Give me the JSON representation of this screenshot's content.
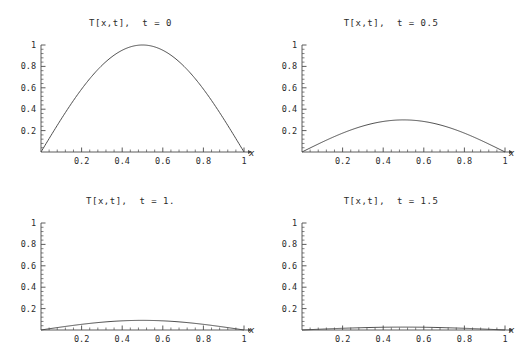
{
  "figure": {
    "name": "heat-equation-time-series",
    "layout": {
      "rows": 2,
      "cols": 2
    },
    "background_color": "#ffffff",
    "line_color": "#454545",
    "axis_color": "#4a4a4a",
    "text_color": "#2b2b2b"
  },
  "panels": [
    {
      "id": "panel-t0",
      "title": "T[x,t],  t = 0",
      "title_prefix": "T",
      "time_value": "0",
      "xlabel": "x",
      "ylabel": "",
      "peak": 1.0
    },
    {
      "id": "panel-t05",
      "title": "T[x,t],  t = 0.5",
      "title_prefix": "T",
      "time_value": "0.5",
      "xlabel": "x",
      "ylabel": "",
      "peak": 0.3
    },
    {
      "id": "panel-t1",
      "title": "T[x,t],  t = 1.",
      "title_prefix": "T",
      "time_value": "1.",
      "xlabel": "x",
      "ylabel": "",
      "peak": 0.09
    },
    {
      "id": "panel-t15",
      "title": "T[x,t],  t = 1.5",
      "title_prefix": "T",
      "time_value": "1.5",
      "xlabel": "x",
      "ylabel": "",
      "peak": 0.027
    }
  ],
  "axes": {
    "x_ticks": [
      "0.2",
      "0.4",
      "0.6",
      "0.8",
      "1"
    ],
    "x_tick_values": [
      0.2,
      0.4,
      0.6,
      0.8,
      1.0
    ],
    "y_ticks": [
      "0.2",
      "0.4",
      "0.6",
      "0.8",
      "1"
    ],
    "y_tick_values": [
      0.2,
      0.4,
      0.6,
      0.8,
      1.0
    ],
    "xlim": [
      0,
      1
    ],
    "ylim": [
      0,
      1
    ],
    "minor_ticks_per_major": 4,
    "grid": false
  },
  "chart_data": {
    "type": "line",
    "xlabel": "x",
    "ylabel": "T[x,t]",
    "xlim": [
      0,
      1
    ],
    "ylim": [
      0,
      1
    ],
    "grid": false,
    "legend": "none",
    "x": [
      0,
      0.05,
      0.1,
      0.15,
      0.2,
      0.25,
      0.3,
      0.35,
      0.4,
      0.45,
      0.5,
      0.55,
      0.6,
      0.65,
      0.7,
      0.75,
      0.8,
      0.85,
      0.9,
      0.95,
      1
    ],
    "series": [
      {
        "name": "t = 0",
        "panel": 0,
        "peak": 1.0,
        "values": [
          0,
          0.156,
          0.309,
          0.454,
          0.588,
          0.707,
          0.809,
          0.891,
          0.951,
          0.988,
          1.0,
          0.988,
          0.951,
          0.891,
          0.809,
          0.707,
          0.588,
          0.454,
          0.309,
          0.156,
          0
        ]
      },
      {
        "name": "t = 0.5",
        "panel": 1,
        "peak": 0.3,
        "values": [
          0,
          0.047,
          0.093,
          0.136,
          0.176,
          0.212,
          0.243,
          0.267,
          0.285,
          0.296,
          0.3,
          0.296,
          0.285,
          0.267,
          0.243,
          0.212,
          0.176,
          0.136,
          0.093,
          0.047,
          0
        ]
      },
      {
        "name": "t = 1.",
        "panel": 2,
        "peak": 0.09,
        "values": [
          0,
          0.014,
          0.028,
          0.041,
          0.053,
          0.064,
          0.073,
          0.08,
          0.086,
          0.089,
          0.09,
          0.089,
          0.086,
          0.08,
          0.073,
          0.064,
          0.053,
          0.041,
          0.028,
          0.014,
          0
        ]
      },
      {
        "name": "t = 1.5",
        "panel": 3,
        "peak": 0.027,
        "values": [
          0,
          0.004,
          0.008,
          0.012,
          0.016,
          0.019,
          0.022,
          0.024,
          0.026,
          0.027,
          0.027,
          0.027,
          0.026,
          0.024,
          0.022,
          0.019,
          0.016,
          0.012,
          0.008,
          0.004,
          0
        ]
      }
    ]
  }
}
